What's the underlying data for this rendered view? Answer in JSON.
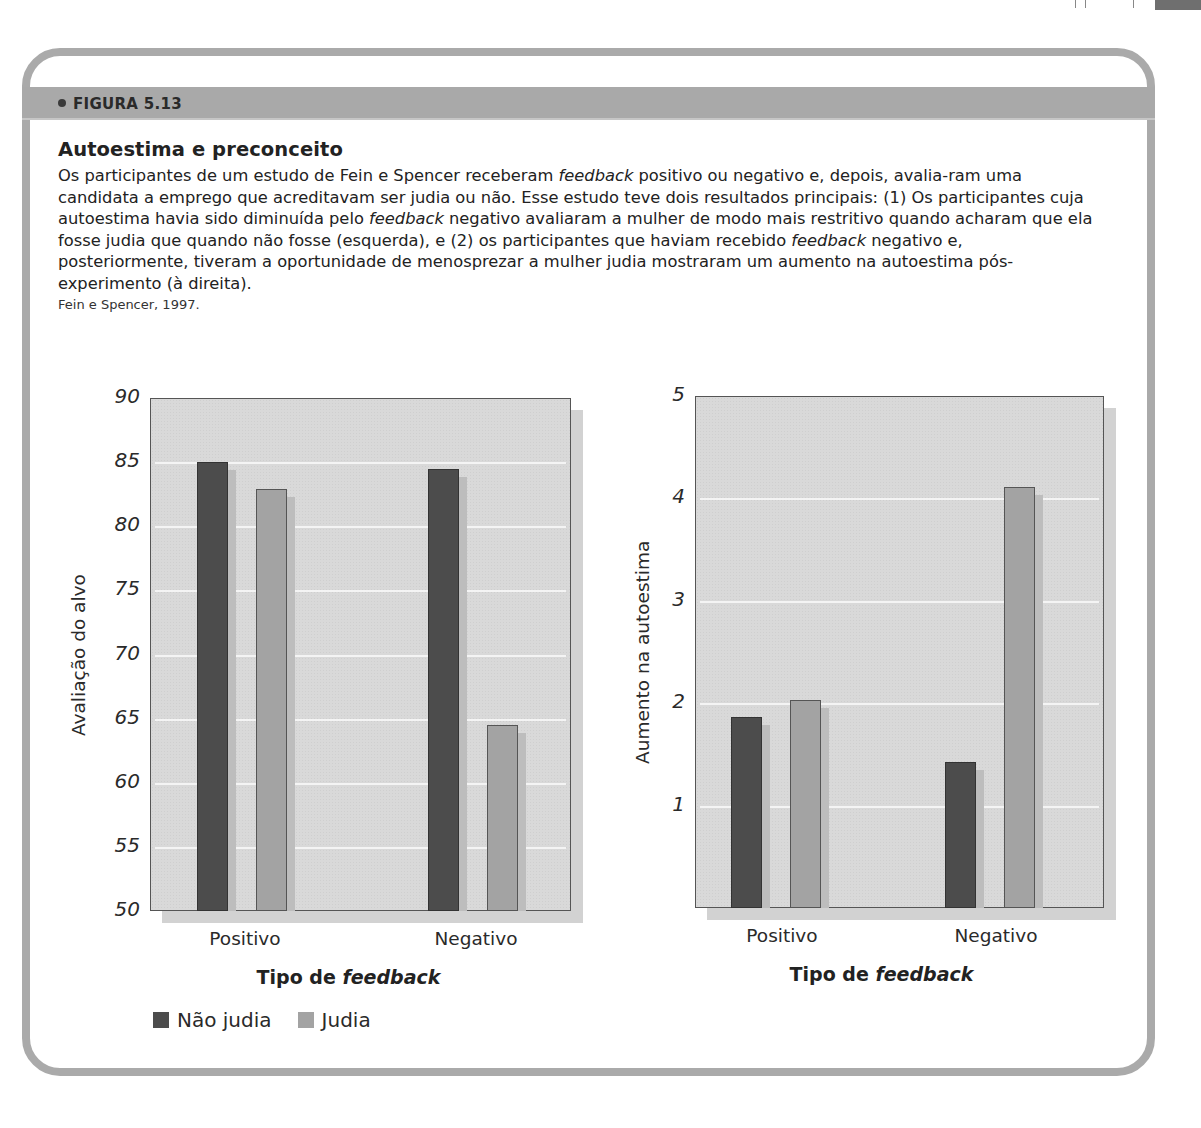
{
  "figure": {
    "label": "FIGURA 5.13",
    "title": "Autoestima e preconceito",
    "description_parts": [
      {
        "text": "Os participantes de um estudo de Fein e Spencer receberam ",
        "italic": false
      },
      {
        "text": "feedback",
        "italic": true
      },
      {
        "text": " positivo ou negativo e, depois, avalia-ram uma candidata a emprego que acreditavam ser judia ou não. Esse estudo teve dois resultados principais: (1) Os participantes cuja autoestima havia sido diminuída pelo ",
        "italic": false
      },
      {
        "text": "feedback",
        "italic": true
      },
      {
        "text": " negativo avaliaram a mulher de modo mais restritivo quando acharam que ela fosse judia que quando não fosse (esquerda), e (2) os participantes que haviam recebido ",
        "italic": false
      },
      {
        "text": "feedback",
        "italic": true
      },
      {
        "text": " negativo e, posteriormente, tiveram a oportunidade de menosprezar a mulher judia mostraram um aumento na autoestima pós-experimento (à direita).",
        "italic": false
      }
    ],
    "source": "Fein e Spencer, 1997."
  },
  "legend": {
    "items": [
      {
        "label": "Não judia",
        "color": "#4c4c4c"
      },
      {
        "label": "Judia",
        "color": "#a3a3a3"
      }
    ]
  },
  "chart_data": [
    {
      "type": "bar",
      "title": "",
      "xlabel": "Tipo de feedback",
      "xlabel_parts": {
        "plain": "Tipo de ",
        "italic": "feedback"
      },
      "ylabel": "Avaliação do alvo",
      "categories": [
        "Positivo",
        "Negativo"
      ],
      "series": [
        {
          "name": "Não judia",
          "color": "#4c4c4c",
          "values": [
            85.0,
            84.5
          ]
        },
        {
          "name": "Judia",
          "color": "#a3a3a3",
          "values": [
            82.9,
            64.5
          ]
        }
      ],
      "ylim": [
        50,
        90
      ],
      "yticks": [
        50,
        55,
        60,
        65,
        70,
        75,
        80,
        85,
        90
      ],
      "grid": true,
      "legend_position": "bottom-left"
    },
    {
      "type": "bar",
      "title": "",
      "xlabel": "Tipo de feedback",
      "xlabel_parts": {
        "plain": "Tipo de ",
        "italic": "feedback"
      },
      "ylabel": "Aumento na autoestima",
      "categories": [
        "Positivo",
        "Negativo"
      ],
      "series": [
        {
          "name": "Não judia",
          "color": "#4c4c4c",
          "values": [
            1.87,
            1.43
          ]
        },
        {
          "name": "Judia",
          "color": "#a3a3a3",
          "values": [
            2.03,
            4.11
          ]
        }
      ],
      "ylim": [
        0,
        5
      ],
      "yticks": [
        1,
        2,
        3,
        4,
        5
      ],
      "grid": true,
      "legend_position": "none"
    }
  ]
}
